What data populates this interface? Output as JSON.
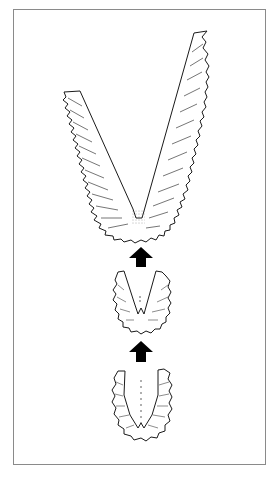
{
  "figure": {
    "stages": [
      {
        "id": "stage-1",
        "position": "bottom",
        "shape": "U-shaped, narrow, toothed rim"
      },
      {
        "id": "stage-2",
        "position": "middle",
        "shape": "U/V-shaped, toothed rim"
      },
      {
        "id": "stage-3",
        "position": "top",
        "shape": "large V-shaped, elongated arms, toothed rim"
      }
    ],
    "arrows": [
      {
        "id": "arrow-1",
        "from": "stage-1",
        "to": "stage-2",
        "direction": "up"
      },
      {
        "id": "arrow-2",
        "from": "stage-2",
        "to": "stage-3",
        "direction": "up"
      }
    ],
    "colors": {
      "line": "#1a1a1a",
      "arrow": "#000000",
      "frame": "#8a8a8a",
      "background": "#ffffff"
    }
  }
}
